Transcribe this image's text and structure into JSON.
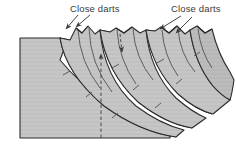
{
  "diagram": {
    "type": "sewing-pattern-slash-and-spread",
    "background_color": "#ffffff",
    "pattern_fill_color": "#c6c6c6",
    "pattern_fill_shadow": "#b4b4b4",
    "spread_gap_color": "#fbfbfb",
    "outline_color": "#2c2c2c",
    "seam_line_color": "#3c3c3c",
    "dash_line_color": "#3a3a3a",
    "label_color": "#3a3a3a"
  },
  "labels": [
    {
      "id": "close-darts-left",
      "text": "Close darts",
      "x": 70,
      "y": 9,
      "arrows": [
        {
          "from_x": 78,
          "from_y": 15,
          "to_x": 66,
          "to_y": 29
        },
        {
          "from_x": 90,
          "from_y": 15,
          "to_x": 76,
          "to_y": 27
        }
      ]
    },
    {
      "id": "close-darts-right",
      "text": "Close darts",
      "x": 171,
      "y": 9,
      "arrows": [
        {
          "from_x": 181,
          "from_y": 16,
          "to_x": 160,
          "to_y": 29
        },
        {
          "from_x": 192,
          "from_y": 17,
          "to_x": 176,
          "to_y": 33
        }
      ]
    }
  ],
  "grainline": {
    "id": "grainline-dashed",
    "x": 101,
    "top_y": 51,
    "bottom_y": 138,
    "arrow_direction": "up"
  },
  "panels": [
    {
      "id": "panel-main-left",
      "note": "large rectangular body of the pattern with flat top edge"
    },
    {
      "id": "panel-wedge-1",
      "note": "first slashed-and-spread section"
    },
    {
      "id": "panel-wedge-2",
      "note": "second slashed-and-spread section"
    },
    {
      "id": "panel-wedge-3",
      "note": "third slashed-and-spread section"
    },
    {
      "id": "panel-wedge-4",
      "note": "outermost slashed-and-spread section"
    }
  ],
  "spread_gaps": [
    {
      "id": "spread-gap-1",
      "note": "white curved wedge opening between panel 1 and 2"
    },
    {
      "id": "spread-gap-2",
      "note": "white curved wedge opening between panel 2 and 3"
    },
    {
      "id": "spread-gap-3",
      "note": "white curved wedge opening between panel 3 and 4"
    }
  ],
  "dart_notches": {
    "id": "top-edge-dart-notches",
    "count": 4,
    "note": "V-shaped notches along the upper edge where darts are closed"
  },
  "tick_marks": {
    "id": "seam-tick-marks",
    "note": "short perpendicular match marks crossing the curved seam lines"
  }
}
